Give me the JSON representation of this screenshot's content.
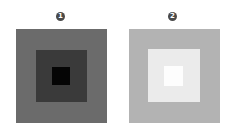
{
  "panels": [
    {
      "label": "1",
      "badge_color": "#4a4a4a",
      "squares": {
        "outer": "#6b6b6b",
        "middle": "#3a3a3a",
        "inner": "#050505"
      }
    },
    {
      "label": "2",
      "badge_color": "#4a4a4a",
      "squares": {
        "outer": "#b3b3b3",
        "middle": "#ebebeb",
        "inner": "#fdfdfd"
      }
    }
  ]
}
